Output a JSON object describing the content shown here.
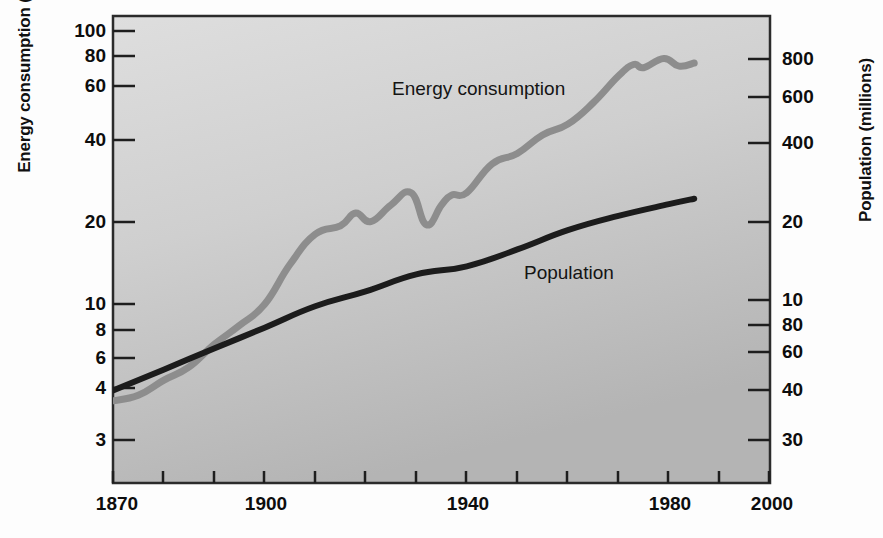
{
  "chart_data": {
    "type": "line",
    "title": "",
    "subtitle": "",
    "xlabel": "",
    "ylabel": "Energy consumption (quadrillion BTUs)",
    "y2label": "Population (millions)",
    "xlim": [
      1870,
      2000
    ],
    "x_ticks_major": [
      1870,
      1900,
      1940,
      1980,
      2000
    ],
    "x_tick_labels": [
      "1870",
      "1900",
      "1940",
      "1980",
      "2000"
    ],
    "x_ticks_minor": [
      1880,
      1890,
      1910,
      1920,
      1930,
      1950,
      1960,
      1970,
      1990
    ],
    "yscale": "log",
    "ylim": [
      2.6,
      115
    ],
    "y_ticks": [
      100,
      80,
      60,
      40,
      20,
      10,
      8,
      6,
      4,
      3
    ],
    "y_tick_labels": [
      "100",
      "80",
      "60",
      "40",
      "20",
      "10",
      "8",
      "6",
      "4",
      "3"
    ],
    "y2scale": "log",
    "y2_ticks": [
      800,
      600,
      400,
      200,
      100,
      80,
      60,
      40,
      30
    ],
    "y2_tick_labels": [
      "800",
      "600",
      "400",
      "20",
      "10",
      "80",
      "60",
      "40",
      "30"
    ],
    "grid": false,
    "legend_position": "inline-annotations",
    "series": [
      {
        "name": "Energy consumption",
        "color": "#8d8d8d",
        "units": "quadrillion BTUs",
        "axis": "left",
        "x": [
          1870,
          1875,
          1880,
          1885,
          1890,
          1895,
          1900,
          1905,
          1910,
          1915,
          1918,
          1921,
          1925,
          1929,
          1932,
          1935,
          1937,
          1940,
          1945,
          1950,
          1955,
          1960,
          1965,
          1970,
          1973,
          1975,
          1979,
          1982,
          1985
        ],
        "values": [
          4.2,
          4.4,
          5.0,
          5.6,
          6.8,
          8.0,
          9.6,
          13.5,
          17.5,
          18.8,
          21.0,
          19.5,
          22.5,
          25.0,
          19.0,
          22.5,
          24.5,
          25.0,
          32.0,
          35.0,
          41.0,
          45.0,
          54.0,
          68.0,
          75.0,
          73.0,
          79.0,
          74.0,
          76.0
        ]
      },
      {
        "name": "Population",
        "color": "#1c1c1c",
        "units": "millions",
        "axis": "right",
        "x": [
          1870,
          1880,
          1890,
          1900,
          1910,
          1920,
          1930,
          1940,
          1950,
          1960,
          1970,
          1980,
          1985
        ],
        "values": [
          46,
          55,
          66,
          79,
          95,
          108,
          125,
          134,
          155,
          183,
          207,
          229,
          240
        ]
      }
    ],
    "annotations": [
      {
        "text": "Energy consumption",
        "x": 1930,
        "y": 52
      },
      {
        "text": "Population",
        "x": 1955,
        "y": 13
      }
    ]
  },
  "axes": {
    "left_title": "Energy consumption (quadrillion BTUs)",
    "right_title": "Population (millions)",
    "left_tick_labels": [
      "100",
      "80",
      "60",
      "40",
      "20",
      "10",
      "8",
      "6",
      "4",
      "3"
    ],
    "right_tick_labels": [
      "800",
      "600",
      "400",
      "20",
      "10",
      "80",
      "60",
      "40",
      "30"
    ],
    "x_tick_labels": [
      "1870",
      "1900",
      "1940",
      "1980",
      "2000"
    ]
  },
  "series_labels": {
    "energy": "Energy consumption",
    "population": "Population"
  },
  "colors": {
    "energy_line": "#8d8d8d",
    "population_line": "#1c1c1c",
    "plot_background_top": "#d9d9d9",
    "plot_background_bottom": "#b9b9b9",
    "frame": "#2b2b2b",
    "page_background": "#fdfdfd",
    "text": "#0d0d0d"
  }
}
